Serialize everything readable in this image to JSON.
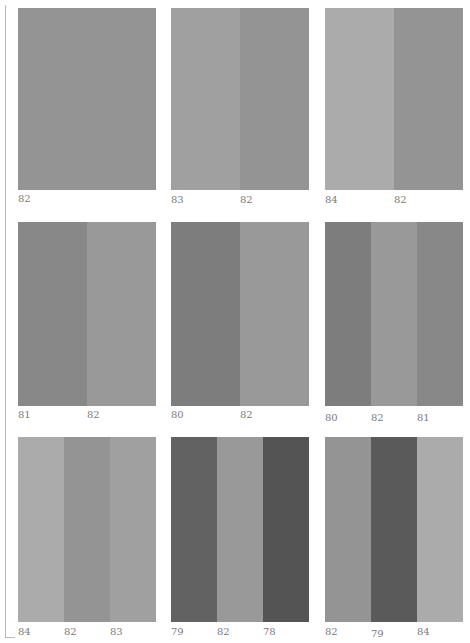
{
  "figure": {
    "panels": [
      {
        "id": "r1c1",
        "stripes": [
          {
            "color": "#949494"
          }
        ],
        "labels": [
          "82"
        ]
      },
      {
        "id": "r1c2",
        "stripes": [
          {
            "color": "#a0a0a0"
          },
          {
            "color": "#949494"
          }
        ],
        "labels": [
          "83",
          "82"
        ]
      },
      {
        "id": "r1c3",
        "stripes": [
          {
            "color": "#ababab"
          },
          {
            "color": "#949494"
          }
        ],
        "labels": [
          "84",
          "82"
        ]
      },
      {
        "id": "r2c1",
        "stripes": [
          {
            "color": "#888888"
          },
          {
            "color": "#999999"
          }
        ],
        "labels": [
          "81",
          "82"
        ]
      },
      {
        "id": "r2c2",
        "stripes": [
          {
            "color": "#7d7d7d"
          },
          {
            "color": "#999999"
          }
        ],
        "labels": [
          "80",
          "82"
        ]
      },
      {
        "id": "r2c3",
        "stripes": [
          {
            "color": "#7d7d7d"
          },
          {
            "color": "#999999"
          },
          {
            "color": "#888888"
          }
        ],
        "labels": [
          "80",
          "82",
          "81"
        ]
      },
      {
        "id": "r3c1",
        "stripes": [
          {
            "color": "#ababab"
          },
          {
            "color": "#949494"
          },
          {
            "color": "#a0a0a0"
          }
        ],
        "labels": [
          "84",
          "82",
          "83"
        ]
      },
      {
        "id": "r3c2",
        "stripes": [
          {
            "color": "#626262"
          },
          {
            "color": "#999999"
          },
          {
            "color": "#545454"
          }
        ],
        "labels": [
          "79",
          "82",
          "78"
        ]
      },
      {
        "id": "r3c3",
        "stripes": [
          {
            "color": "#949494"
          },
          {
            "color": "#5a5a5a"
          },
          {
            "color": "#ababab"
          }
        ],
        "labels": [
          "82",
          "79",
          "84"
        ]
      }
    ]
  },
  "labels": {
    "r1c1": [
      "82"
    ],
    "r1c2": [
      "83",
      "82"
    ],
    "r1c3": [
      "84",
      "82"
    ],
    "r2c1": [
      "81",
      "82"
    ],
    "r2c2": [
      "80",
      "82"
    ],
    "r2c3": [
      "80",
      "82",
      "81"
    ],
    "r3c1": [
      "84",
      "82",
      "83"
    ],
    "r3c2": [
      "79",
      "82",
      "78"
    ],
    "r3c3": [
      "82",
      "79",
      "84"
    ]
  }
}
